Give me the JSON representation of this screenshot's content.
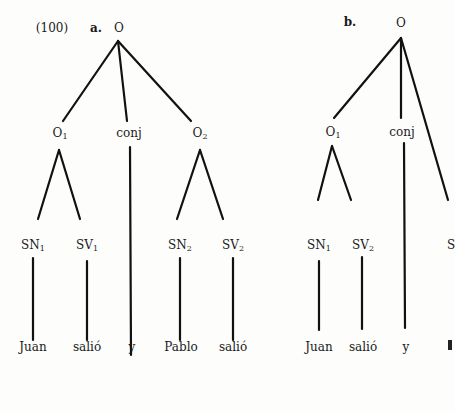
{
  "example_number": "(100)",
  "trees": [
    {
      "id": "a",
      "label": "a.",
      "root": "O",
      "level1": [
        {
          "label": "O",
          "sub": "1"
        },
        {
          "label": "conj",
          "sub": ""
        },
        {
          "label": "O",
          "sub": "2"
        }
      ],
      "level2": [
        {
          "label": "SN",
          "sub": "1"
        },
        {
          "label": "SV",
          "sub": "1"
        },
        {
          "label": "SN",
          "sub": "2"
        },
        {
          "label": "SV",
          "sub": "2"
        }
      ],
      "words": [
        "Juan",
        "salió",
        "y",
        "Pablo",
        "salió"
      ]
    },
    {
      "id": "b",
      "label": "b.",
      "root": "O",
      "level1": [
        {
          "label": "O",
          "sub": "1"
        },
        {
          "label": "conj",
          "sub": ""
        }
      ],
      "level2": [
        {
          "label": "SN",
          "sub": "1"
        },
        {
          "label": "SV",
          "sub": "2"
        },
        {
          "label": "S",
          "sub": ""
        }
      ],
      "words": [
        "Juan",
        "salió",
        "y"
      ]
    }
  ]
}
